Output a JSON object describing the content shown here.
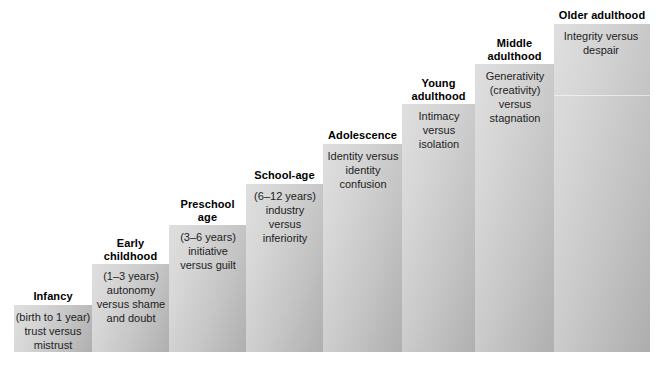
{
  "figure": {
    "background_color": "#ffffff",
    "step_fill_light": "#d6d6d6",
    "step_fill_dark": "#909090",
    "label_plaque_color": "#ffffff",
    "text_color": "#1d1d1d"
  },
  "stages": [
    {
      "id": "infancy",
      "label": "Infancy",
      "body": "(birth to 1 year)\ntrust versus\nmistrust"
    },
    {
      "id": "early-childhood",
      "label": "Early\nchildhood",
      "body": "(1–3 years)\nautonomy\nversus shame\nand doubt"
    },
    {
      "id": "preschool-age",
      "label": "Preschool\nage",
      "body": "(3–6 years)\ninitiative\nversus guilt"
    },
    {
      "id": "school-age",
      "label": "School-age",
      "body": "(6–12 years)\nindustry\nversus\ninferiority"
    },
    {
      "id": "adolescence",
      "label": "Adolescence",
      "body": "Identity versus\nidentity\nconfusion"
    },
    {
      "id": "young-adulthood",
      "label": "Young\nadulthood",
      "body": "Intimacy\nversus\nisolation"
    },
    {
      "id": "middle-adulthood",
      "label": "Middle\nadulthood",
      "body": "Generativity\n(creativity)\nversus\nstagnation"
    },
    {
      "id": "older-adulthood",
      "label": "Older adulthood",
      "body": "Integrity versus\ndespair"
    }
  ]
}
